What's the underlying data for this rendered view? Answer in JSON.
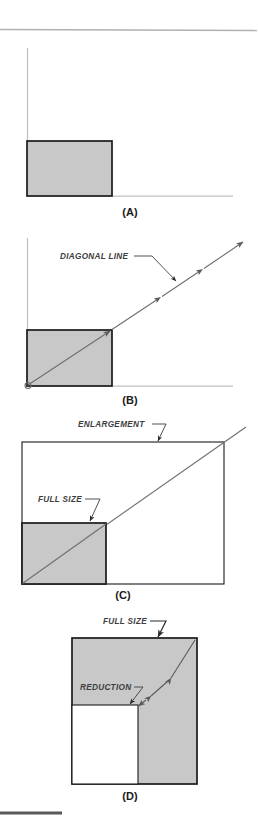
{
  "figure": {
    "title_rule_top": "top-divider",
    "title_rule_bottom": "bottom-divider",
    "panels": [
      {
        "id": "A",
        "label": "(A)",
        "description": "original size box with axes",
        "callouts": []
      },
      {
        "id": "B",
        "label": "(B)",
        "description": "box with diagonal line projected outward",
        "callouts": [
          {
            "name": "diagonal-line-callout",
            "text": "DIAGONAL LINE"
          }
        ]
      },
      {
        "id": "C",
        "label": "(C)",
        "description": "enlargement rectangle containing full size box on shared diagonal",
        "callouts": [
          {
            "name": "enlargement-callout",
            "text": "ENLARGEMENT"
          },
          {
            "name": "full-size-callout",
            "text": "FULL SIZE"
          }
        ]
      },
      {
        "id": "D",
        "label": "(D)",
        "description": "full size box containing a reduction box on shared diagonal",
        "callouts": [
          {
            "name": "full-size-callout",
            "text": "FULL SIZE"
          },
          {
            "name": "reduction-callout",
            "text": "REDUCTION"
          }
        ]
      }
    ],
    "colors": {
      "box_fill": "#c8c8c8",
      "box_stroke": "#1a1a1a",
      "axis_stroke": "#b9b9b9",
      "diagonal_stroke": "#6e6e6e",
      "leader_stroke": "#3d3d3d",
      "rule_top": "#b0b0b0",
      "rule_bottom": "#5a5a5a",
      "page_background": "#ffffff",
      "label_text": "#1a1a1a",
      "callout_text": "#3d3d3d"
    }
  }
}
